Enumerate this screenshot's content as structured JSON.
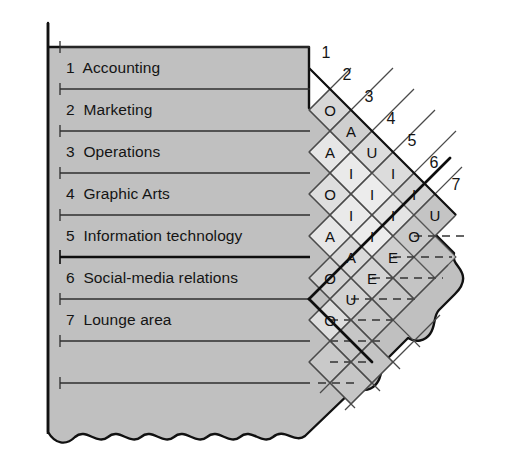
{
  "diagram": {
    "kind": "relationship-chart",
    "title": "",
    "colors": {
      "body_fill": "#c0c0c0",
      "cell_fill_light": "#e8e8e8",
      "cell_fill_mid": "#d0d0d0",
      "cell_fill_dark": "#c0c0c0",
      "outline": "#1a1a1a",
      "rule": "#2b2b2b",
      "text": "#111111",
      "page_bg": "#ffffff"
    },
    "departments": [
      {
        "number": "1",
        "name": "Accounting"
      },
      {
        "number": "2",
        "name": "Marketing"
      },
      {
        "number": "3",
        "name": "Operations"
      },
      {
        "number": "4",
        "name": "Graphic Arts"
      },
      {
        "number": "5",
        "name": "Information technology"
      },
      {
        "number": "6",
        "name": "Social-media relations"
      },
      {
        "number": "7",
        "name": "Lounge area"
      }
    ],
    "column_numbers": [
      "1",
      "2",
      "3",
      "4",
      "5",
      "6",
      "7"
    ],
    "relationships": [
      {
        "from": "1",
        "to": "2",
        "rating": "O"
      },
      {
        "from": "1",
        "to": "3",
        "rating": "A"
      },
      {
        "from": "1",
        "to": "4",
        "rating": "O"
      },
      {
        "from": "1",
        "to": "5",
        "rating": "A"
      },
      {
        "from": "1",
        "to": "6",
        "rating": "O"
      },
      {
        "from": "1",
        "to": "7",
        "rating": "O"
      },
      {
        "from": "2",
        "to": "3",
        "rating": "A"
      },
      {
        "from": "2",
        "to": "4",
        "rating": "I"
      },
      {
        "from": "2",
        "to": "5",
        "rating": "I"
      },
      {
        "from": "2",
        "to": "6",
        "rating": "A"
      },
      {
        "from": "2",
        "to": "7",
        "rating": "U"
      },
      {
        "from": "3",
        "to": "4",
        "rating": "U"
      },
      {
        "from": "3",
        "to": "5",
        "rating": "I"
      },
      {
        "from": "3",
        "to": "6",
        "rating": "I"
      },
      {
        "from": "3",
        "to": "7",
        "rating": "E"
      },
      {
        "from": "4",
        "to": "5",
        "rating": "I"
      },
      {
        "from": "4",
        "to": "6",
        "rating": "I"
      },
      {
        "from": "4",
        "to": "7",
        "rating": "E"
      },
      {
        "from": "5",
        "to": "6",
        "rating": "I"
      },
      {
        "from": "5",
        "to": "7",
        "rating": "O"
      },
      {
        "from": "6",
        "to": "7",
        "rating": "U"
      }
    ]
  }
}
